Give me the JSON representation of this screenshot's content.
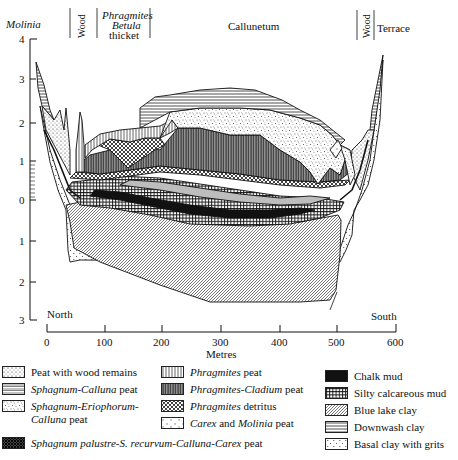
{
  "figure": {
    "type": "stratigraphic-cross-section",
    "vegetation_zones": [
      {
        "label": "Molinia",
        "italic": true
      },
      {
        "label": "Wood",
        "rotated": true
      },
      {
        "label_lines": [
          "Phragmites",
          "Betula",
          "thicket"
        ]
      },
      {
        "label": "Callunetum"
      },
      {
        "label": "Wood",
        "rotated": true
      },
      {
        "label": "Terrace"
      }
    ],
    "y_axis": {
      "ticks": [
        "4",
        "3",
        "2",
        "1",
        "0",
        "1",
        "2",
        "3"
      ],
      "unit_implied": "metres above/below datum"
    },
    "x_axis": {
      "label": "Metres",
      "ticks": [
        "0",
        "100",
        "200",
        "300",
        "400",
        "500",
        "600"
      ],
      "end_labels": {
        "left": "North",
        "right": "South"
      }
    }
  },
  "legend": {
    "items": [
      {
        "id": "wood-peat",
        "pattern": "dotted-grid",
        "label": "Peat with wood remains"
      },
      {
        "id": "sphag-calluna",
        "pattern": "horizontal-double-lines",
        "label_italic": "Sphagnum-Calluna",
        "label_rest": " peat"
      },
      {
        "id": "sphag-erio",
        "pattern": "stipple",
        "label_italic": "Sphagnum-Eriophorum-",
        "label_line2_italic": "Calluna",
        "label_line2_rest": " peat"
      },
      {
        "id": "sphag-palustre",
        "pattern": "dark-crosshatch",
        "label_italic": "Sphagnum palustre-S. recurvum-Calluna-Carex",
        "label_rest": " peat"
      },
      {
        "id": "phrag",
        "pattern": "vertical-lines",
        "label_italic": "Phragmites",
        "label_rest": " peat"
      },
      {
        "id": "phrag-clad",
        "pattern": "dense-vertical-lines",
        "label_italic": "Phragmites-Cladium",
        "label_rest": " peat"
      },
      {
        "id": "phrag-det",
        "pattern": "dense-crosshatch",
        "label_italic": "Phragmites",
        "label_rest": " detritus"
      },
      {
        "id": "carex-molinia",
        "pattern": "c-letters",
        "label_italic": "Carex",
        "label_mid": " and ",
        "label_italic2": "Molinia",
        "label_rest": " peat"
      },
      {
        "id": "chalk-mud",
        "pattern": "solid-black",
        "label": "Chalk mud"
      },
      {
        "id": "silty-mud",
        "pattern": "grid",
        "label": "Silty calcareous mud"
      },
      {
        "id": "blue-clay",
        "pattern": "diagonal-hatch",
        "label": "Blue lake clay"
      },
      {
        "id": "downwash",
        "pattern": "horizontal-lines",
        "label": "Downwash clay"
      },
      {
        "id": "basal-clay",
        "pattern": "triangle-dots",
        "label": "Basal clay with grits"
      }
    ]
  },
  "colors": {
    "ink": "#111111",
    "background": "#ffffff",
    "grey_band": "#bdbdbd"
  }
}
